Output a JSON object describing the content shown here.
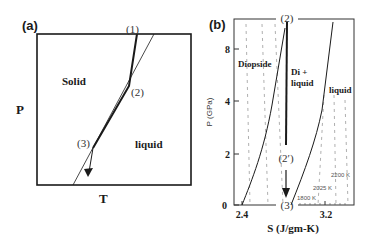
{
  "panel_a": {
    "label": "(a)",
    "y_axis_label": "P",
    "x_axis_label": "T",
    "region_solid": "Solid",
    "region_liquid": "liquid",
    "point_1": "(1)",
    "point_2": "(2)",
    "point_3": "(3)"
  },
  "panel_b": {
    "label": "(b)",
    "y_axis_label": "P (GPa)",
    "x_axis_label": "S (J/gm-K)",
    "y_ticks": [
      "0",
      "2",
      "4",
      "8"
    ],
    "x_ticks": [
      "2.4",
      "3.2"
    ],
    "region_diopside": "Diopside",
    "region_di_liquid_line1": "Di +",
    "region_di_liquid_line2": "liquid",
    "region_liquid": "liquid",
    "point_2": "(2)",
    "point_2prime": "(2′)",
    "point_3": "(3)",
    "isotherms": [
      "1800 K",
      "2025 K",
      "2200 K"
    ]
  },
  "colors": {
    "line": "#1a1a1a",
    "dashed": "#9a9a9a",
    "background": "#ffffff"
  }
}
